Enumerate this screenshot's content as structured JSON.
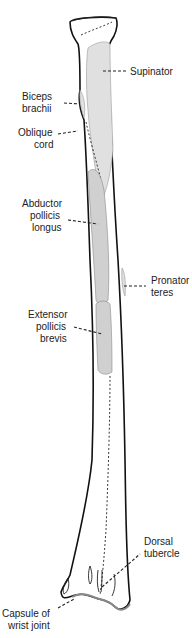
{
  "figure": {
    "labels": {
      "supinator": "Supinator",
      "biceps_1": "Biceps",
      "biceps_2": "brachii",
      "oblique_1": "Oblique",
      "oblique_2": "cord",
      "abductor_1": "Abductor",
      "abductor_2": "pollicis",
      "abductor_3": "longus",
      "pronator_1": "Pronator",
      "pronator_2": "teres",
      "extensor_1": "Extensor",
      "extensor_2": "pollicis",
      "extensor_3": "brevis",
      "dorsal_1": "Dorsal",
      "dorsal_2": "tubercle",
      "capsule_1": "Capsule of",
      "capsule_2": "wrist joint"
    },
    "colors": {
      "muscle_fill": "#d0d0d0",
      "bone_outline": "#111111",
      "background": "#ffffff"
    }
  }
}
